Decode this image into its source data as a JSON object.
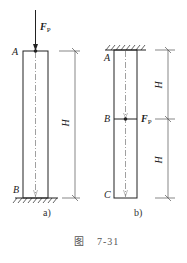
{
  "figure": {
    "caption_prefix": "图",
    "caption_number": "7-31",
    "panels": [
      {
        "id": "a",
        "sublabel": "a)",
        "load": {
          "symbol": "F",
          "subscript": "P",
          "point": "A",
          "direction": "down"
        },
        "points": {
          "top": "A",
          "bottom": "B"
        },
        "support": "fixed-bottom",
        "dimension": "H"
      },
      {
        "id": "b",
        "sublabel": "b)",
        "load": {
          "symbol": "F",
          "subscript": "P",
          "point": "B",
          "direction": "none-shown"
        },
        "points": {
          "top": "A",
          "middle": "B",
          "bottom": "C"
        },
        "support": "fixed-top",
        "dimensions": [
          "H",
          "H"
        ]
      }
    ]
  }
}
